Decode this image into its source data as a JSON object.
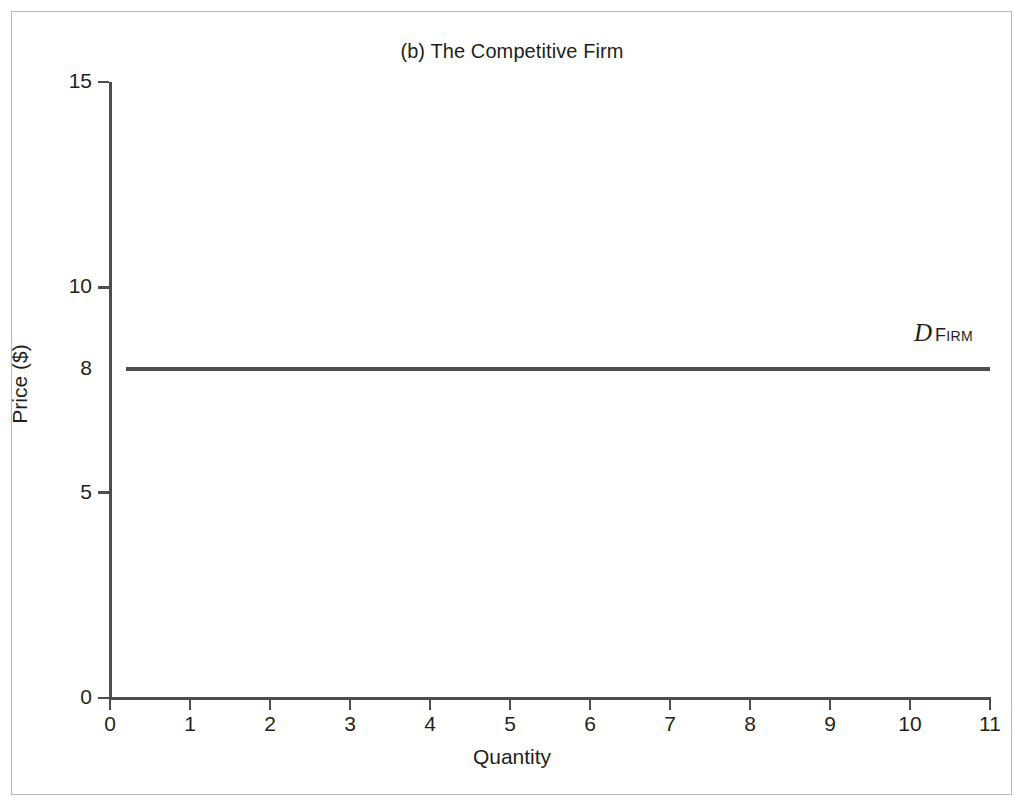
{
  "figure": {
    "title": "(b) The Competitive Firm",
    "background_color": "#ffffff",
    "frame_color": "#b9b9b9",
    "ink_color": "#4d4d4f",
    "text_color": "#231f20"
  },
  "chart_data": {
    "type": "line",
    "title": "(b) The Competitive Firm",
    "xlabel": "Quantity",
    "ylabel": "Price ($)",
    "xlim": [
      0,
      11
    ],
    "ylim": [
      0,
      15
    ],
    "grid": false,
    "legend": "none",
    "x_ticks": [
      0,
      1,
      2,
      3,
      4,
      5,
      6,
      7,
      8,
      9,
      10,
      11
    ],
    "x_tick_labels": [
      "0",
      "1",
      "2",
      "3",
      "4",
      "5",
      "6",
      "7",
      "8",
      "9",
      "10",
      "11"
    ],
    "y_ticks": [
      0,
      5,
      10,
      15
    ],
    "y_tick_labels": [
      "0",
      "5",
      "10",
      "15"
    ],
    "y_extra_labels": [
      {
        "value": 8,
        "label": "8",
        "has_tick": false
      }
    ],
    "series": [
      {
        "name": "D_FIRM",
        "label_letter": "D",
        "label_subscript": "FIRM",
        "description": "Perfectly elastic (horizontal) firm demand curve at price $8",
        "color": "#4d4d4f",
        "line_width_px": 4,
        "x": [
          0.2,
          11
        ],
        "y": [
          8,
          8
        ]
      }
    ],
    "annotations": [
      {
        "text": "D FIRM",
        "x": 10.05,
        "y": 8.8,
        "letter": "D",
        "subscript": "FIRM"
      }
    ]
  }
}
